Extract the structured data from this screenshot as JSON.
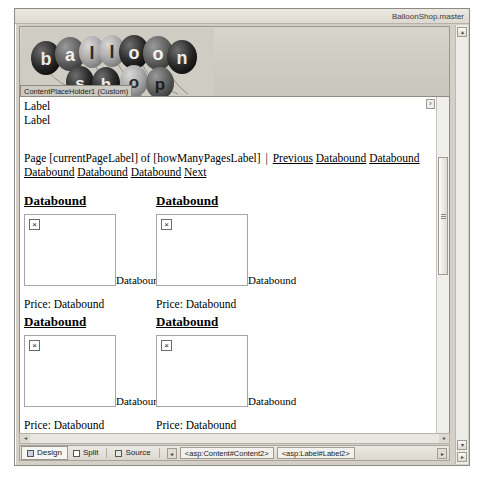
{
  "window": {
    "master_file": "BalloonShop.master",
    "placeholder_tab": "ContentPlaceHolder1 (Custom)"
  },
  "logo": {
    "alt": "balloon shop",
    "top_word": "balloon",
    "bottom_word": "shop",
    "top_letters": [
      "b",
      "a",
      "l",
      "l",
      "o",
      "o",
      "n"
    ],
    "bottom_letters": [
      "s",
      "h",
      "o",
      "p"
    ]
  },
  "content": {
    "labels": [
      "Label",
      "Label"
    ],
    "pager": {
      "prefix": "Page [currentPageLabel] of [howManyPagesLabel]",
      "separator": "|",
      "previous": "Previous",
      "next": "Next",
      "page_links": [
        "Databound",
        "Databound",
        "Databound",
        "Databound",
        "Databound"
      ]
    },
    "product_rows": [
      {
        "products": [
          {
            "title": "Databound",
            "image_caption": "Databound",
            "price": "Price: Databound"
          },
          {
            "title": "Databound",
            "image_caption": "Databound",
            "price": "Price: Databound"
          }
        ]
      },
      {
        "products": [
          {
            "title": "Databound",
            "image_caption": "Databound",
            "price": "Price: Databound"
          },
          {
            "title": "Databound",
            "image_caption": "Databound",
            "price": "Price: Databound"
          }
        ]
      },
      {
        "products": [
          {
            "title": "Databound",
            "image_caption": "",
            "price": ""
          },
          {
            "title": "",
            "image_caption": "",
            "price": ""
          }
        ]
      }
    ],
    "broken_image_glyph": "×"
  },
  "tabbar": {
    "views": [
      {
        "label": "Design",
        "active": true
      },
      {
        "label": "Split",
        "active": false
      },
      {
        "label": "Source",
        "active": false
      }
    ],
    "breadcrumbs": [
      "<asp:Content#Content2>",
      "<asp:Label#Label2>"
    ],
    "scroll_left_glyph": "◂",
    "scroll_right_glyph": "▸"
  },
  "scrollbars": {
    "up_glyph": "▴",
    "down_glyph": "▾",
    "left_glyph": "◂",
    "right_glyph": "▸",
    "handle_glyph": "›"
  }
}
